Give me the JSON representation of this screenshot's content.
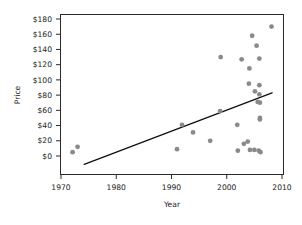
{
  "chart_data": {
    "type": "scatter",
    "title": "",
    "xlabel": "Year",
    "ylabel": "Price",
    "xlim": [
      1968,
      2012
    ],
    "ylim": [
      -11,
      190
    ],
    "grid": false,
    "legend": "none",
    "x_ticks": [
      1970,
      1980,
      1990,
      2000,
      2010
    ],
    "x_tick_labels": [
      "1970",
      "1980",
      "1990",
      "2000",
      "2010"
    ],
    "y_ticks": [
      0,
      20,
      40,
      60,
      80,
      100,
      120,
      140,
      160,
      180
    ],
    "y_tick_labels": [
      "$0",
      "$20",
      "$40",
      "$60",
      "$80",
      "$100",
      "$120",
      "$140",
      "$160",
      "$180"
    ],
    "point_color": "#8a8a8a",
    "point_radius": 2.4,
    "line_color": "#111111",
    "points": [
      {
        "x": 1972.1,
        "y": 5
      },
      {
        "x": 1973.0,
        "y": 12
      },
      {
        "x": 1991.0,
        "y": 9
      },
      {
        "x": 1991.9,
        "y": 41
      },
      {
        "x": 1993.9,
        "y": 31
      },
      {
        "x": 1997.0,
        "y": 20
      },
      {
        "x": 1998.8,
        "y": 59
      },
      {
        "x": 1998.9,
        "y": 130
      },
      {
        "x": 2001.9,
        "y": 41
      },
      {
        "x": 2002.0,
        "y": 7
      },
      {
        "x": 2002.7,
        "y": 127
      },
      {
        "x": 2003.1,
        "y": 16
      },
      {
        "x": 2003.8,
        "y": 19
      },
      {
        "x": 2004.0,
        "y": 95
      },
      {
        "x": 2004.1,
        "y": 115
      },
      {
        "x": 2004.2,
        "y": 8
      },
      {
        "x": 2004.6,
        "y": 158
      },
      {
        "x": 2005.0,
        "y": 8
      },
      {
        "x": 2005.1,
        "y": 85
      },
      {
        "x": 2005.4,
        "y": 145
      },
      {
        "x": 2005.6,
        "y": 71
      },
      {
        "x": 2005.8,
        "y": 7
      },
      {
        "x": 2005.9,
        "y": 128
      },
      {
        "x": 2005.9,
        "y": 93
      },
      {
        "x": 2005.9,
        "y": 81
      },
      {
        "x": 2006.0,
        "y": 70
      },
      {
        "x": 2006.0,
        "y": 50
      },
      {
        "x": 2006.0,
        "y": 48
      },
      {
        "x": 2006.1,
        "y": 5
      },
      {
        "x": 2008.1,
        "y": 170
      }
    ],
    "trend_line": {
      "name": "linear fit",
      "x_start": 1974.2,
      "y_start": -11,
      "x_end": 2008.2,
      "y_end": 83
    }
  }
}
